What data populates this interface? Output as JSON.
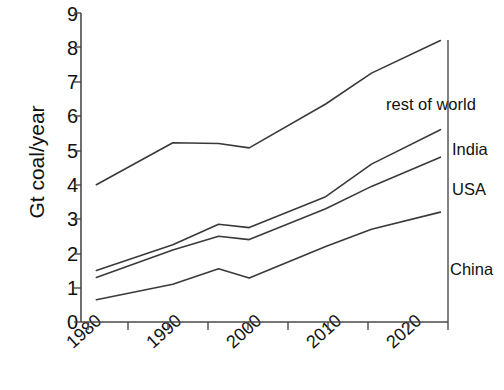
{
  "chart_data": {
    "type": "line",
    "title": "",
    "subtitle": "",
    "xlabel": "",
    "ylabel": "Gt coal/year",
    "xlim": [
      1978,
      2026
    ],
    "ylim": [
      0,
      9
    ],
    "grid": false,
    "legend_position": "right-of-plot (inline series labels)",
    "x_tick_labels": [
      "1980",
      "1990",
      "2000",
      "2010",
      "2020"
    ],
    "x_tick_values": [
      1980,
      1990,
      2000,
      2010,
      2020
    ],
    "x_minor_ticks": [
      1985,
      1995,
      2005,
      2015,
      2025
    ],
    "y_tick_labels": [
      "0",
      "1",
      "2",
      "3",
      "4",
      "5",
      "6",
      "7",
      "8",
      "9"
    ],
    "y_tick_values": [
      0,
      1,
      2,
      3,
      4,
      5,
      6,
      7,
      8,
      9
    ],
    "note": "Cumulative (stacked) curves: each line is the running total of China, +USA, +India, +rest of world",
    "x": [
      1980,
      1990,
      1996,
      2000,
      2010,
      2016,
      2025
    ],
    "series": [
      {
        "name": "China",
        "label": "China",
        "color": "#3a3a3a",
        "values": [
          0.65,
          1.1,
          1.55,
          1.28,
          2.2,
          2.7,
          3.2
        ]
      },
      {
        "name": "USA",
        "label": "USA",
        "color": "#3a3a3a",
        "values": [
          1.3,
          2.1,
          2.5,
          2.4,
          3.3,
          3.95,
          4.8
        ]
      },
      {
        "name": "India",
        "label": "India",
        "color": "#3a3a3a",
        "values": [
          1.5,
          2.25,
          2.85,
          2.75,
          3.65,
          4.6,
          5.6
        ]
      },
      {
        "name": "rest of world",
        "label": "rest of world",
        "color": "#3a3a3a",
        "values": [
          4.0,
          5.22,
          5.2,
          5.07,
          6.35,
          7.25,
          8.2
        ]
      }
    ]
  },
  "labels": {
    "rest_of_world": "rest of world",
    "india": "India",
    "usa": "USA",
    "china": "China"
  }
}
